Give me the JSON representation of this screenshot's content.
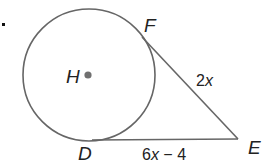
{
  "diagram": {
    "type": "geometry-circle-tangents",
    "bullet": ".",
    "circle": {
      "center_label": "H"
    },
    "points": {
      "F": "F",
      "D": "D",
      "E": "E",
      "H": "H"
    },
    "segments": {
      "FE": {
        "coef": "2",
        "var": "x",
        "expression": "2x"
      },
      "DE": {
        "coef": "6",
        "var": "x",
        "rest": " − 4",
        "expression": "6x − 4"
      }
    },
    "colors": {
      "stroke": "#666666",
      "center_dot": "#707070",
      "text": "#222222"
    }
  }
}
